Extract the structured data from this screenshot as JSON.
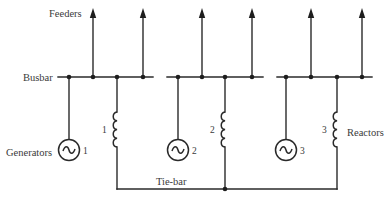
{
  "diagram": {
    "labels": {
      "feeders": "Feeders",
      "busbar": "Busbar",
      "generators": "Generators",
      "reactors": "Reactors",
      "tie_bar": "Tie-bar"
    },
    "sections": [
      {
        "id": "1",
        "generator_label": "1",
        "reactor_label": "1",
        "feeder_count": 2
      },
      {
        "id": "2",
        "generator_label": "2",
        "reactor_label": "2",
        "feeder_count": 2
      },
      {
        "id": "3",
        "generator_label": "3",
        "reactor_label": "3",
        "feeder_count": 2
      }
    ],
    "colors": {
      "line": "#2a2a2a",
      "text": "#3a3a3a",
      "background": "#ffffff"
    }
  }
}
